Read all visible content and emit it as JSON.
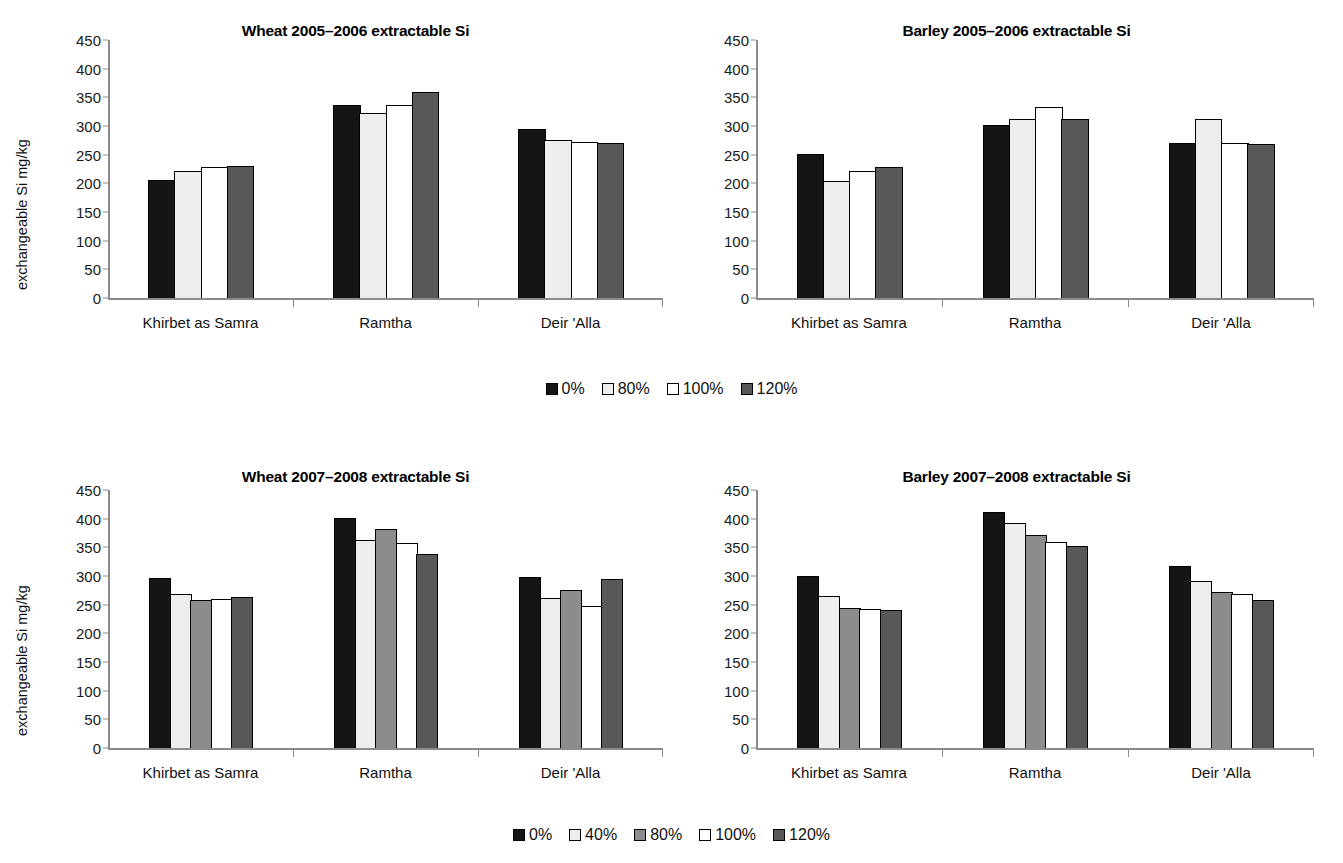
{
  "figure": {
    "ylabel": "exchangeable Si mg/kg",
    "categories": [
      "Khirbet as Samra",
      "Ramtha",
      "Deir 'Alla"
    ],
    "y_ticks": [
      "0",
      "50",
      "100",
      "150",
      "200",
      "250",
      "300",
      "350",
      "400",
      "450"
    ],
    "colors": {
      "black": "#151515",
      "lightgray": "#ededed",
      "midgray": "#8c8c8c",
      "white": "#ffffff",
      "darkgray": "#585858",
      "axis": "#8b8b8b",
      "text": "#111111"
    },
    "legend_top": [
      {
        "label": "0%",
        "color": "#151515"
      },
      {
        "label": "80%",
        "color": "#ededed"
      },
      {
        "label": "100%",
        "color": "#ffffff"
      },
      {
        "label": "120%",
        "color": "#585858"
      }
    ],
    "legend_bottom": [
      {
        "label": "0%",
        "color": "#151515"
      },
      {
        "label": "40%",
        "color": "#ededed"
      },
      {
        "label": "80%",
        "color": "#8c8c8c"
      },
      {
        "label": "100%",
        "color": "#ffffff"
      },
      {
        "label": "120%",
        "color": "#585858"
      }
    ]
  },
  "chart_data": [
    {
      "id": "wheat-2005-2006",
      "type": "bar",
      "title": "Wheat 2005–2006 extractable Si",
      "xlabel": "",
      "ylabel": "exchangeable Si mg/kg",
      "ylim": [
        0,
        450
      ],
      "ytick_step": 50,
      "grid": false,
      "legend_position": "bottom-center-shared",
      "categories": [
        "Khirbet as Samra",
        "Ramtha",
        "Deir 'Alla"
      ],
      "series": [
        {
          "name": "0%",
          "color": "#151515",
          "values": [
            206,
            336,
            295
          ]
        },
        {
          "name": "80%",
          "color": "#ededed",
          "values": [
            222,
            323,
            275
          ]
        },
        {
          "name": "100%",
          "color": "#ffffff",
          "values": [
            229,
            336,
            272
          ]
        },
        {
          "name": "120%",
          "color": "#585858",
          "values": [
            231,
            360,
            270
          ]
        }
      ]
    },
    {
      "id": "barley-2005-2006",
      "type": "bar",
      "title": "Barley 2005–2006 extractable Si",
      "xlabel": "",
      "ylabel": "",
      "ylim": [
        0,
        450
      ],
      "ytick_step": 50,
      "grid": false,
      "legend_position": "bottom-center-shared",
      "categories": [
        "Khirbet as Samra",
        "Ramtha",
        "Deir 'Alla"
      ],
      "series": [
        {
          "name": "0%",
          "color": "#151515",
          "values": [
            251,
            302,
            270
          ]
        },
        {
          "name": "80%",
          "color": "#ededed",
          "values": [
            204,
            312,
            312
          ]
        },
        {
          "name": "100%",
          "color": "#ffffff",
          "values": [
            221,
            333,
            270
          ]
        },
        {
          "name": "120%",
          "color": "#585858",
          "values": [
            229,
            312,
            268
          ]
        }
      ]
    },
    {
      "id": "wheat-2007-2008",
      "type": "bar",
      "title": "Wheat 2007–2008 extractable Si",
      "xlabel": "",
      "ylabel": "exchangeable Si mg/kg",
      "ylim": [
        0,
        450
      ],
      "ytick_step": 50,
      "grid": false,
      "legend_position": "bottom-center-shared",
      "categories": [
        "Khirbet as Samra",
        "Ramtha",
        "Deir 'Alla"
      ],
      "series": [
        {
          "name": "0%",
          "color": "#151515",
          "values": [
            296,
            401,
            299
          ]
        },
        {
          "name": "40%",
          "color": "#ededed",
          "values": [
            268,
            362,
            261
          ]
        },
        {
          "name": "80%",
          "color": "#8c8c8c",
          "values": [
            258,
            382,
            275
          ]
        },
        {
          "name": "100%",
          "color": "#ffffff",
          "values": [
            260,
            358,
            248
          ]
        },
        {
          "name": "120%",
          "color": "#585858",
          "values": [
            264,
            338,
            295
          ]
        }
      ]
    },
    {
      "id": "barley-2007-2008",
      "type": "bar",
      "title": "Barley 2007–2008 extractable Si",
      "xlabel": "",
      "ylabel": "",
      "ylim": [
        0,
        450
      ],
      "ytick_step": 50,
      "grid": false,
      "legend_position": "bottom-center-shared",
      "categories": [
        "Khirbet as Samra",
        "Ramtha",
        "Deir 'Alla"
      ],
      "series": [
        {
          "name": "0%",
          "color": "#151515",
          "values": [
            300,
            412,
            318
          ]
        },
        {
          "name": "40%",
          "color": "#ededed",
          "values": [
            266,
            393,
            292
          ]
        },
        {
          "name": "80%",
          "color": "#8c8c8c",
          "values": [
            244,
            371,
            272
          ]
        },
        {
          "name": "100%",
          "color": "#ffffff",
          "values": [
            242,
            360,
            268
          ]
        },
        {
          "name": "120%",
          "color": "#585858",
          "values": [
            240,
            353,
            259
          ]
        }
      ]
    }
  ]
}
